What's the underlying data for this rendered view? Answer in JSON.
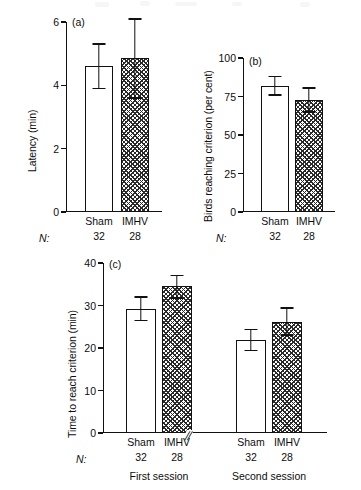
{
  "figure": {
    "panels": [
      "a",
      "b",
      "c"
    ]
  },
  "chart_data": [
    {
      "type": "bar",
      "panel": "(a)",
      "title": "",
      "xlabel": "",
      "ylabel": "Latency (min)",
      "ylim": [
        0,
        6
      ],
      "yticks": [
        0,
        2,
        4,
        6
      ],
      "ytick_labels": [
        "0",
        "2",
        "4",
        "6"
      ],
      "grid": false,
      "legend": "none",
      "categories": [
        "Sham",
        "IMHV"
      ],
      "values": [
        4.6,
        4.85
      ],
      "errors_low": [
        3.9,
        3.6
      ],
      "errors_high": [
        5.3,
        6.1
      ],
      "n_label": "N:",
      "n_values": [
        "32",
        "28"
      ],
      "fills": [
        "open",
        "hatched"
      ]
    },
    {
      "type": "bar",
      "panel": "(b)",
      "title": "",
      "xlabel": "",
      "ylabel": "Birds reaching criterion (per cent)",
      "ylim": [
        0,
        100
      ],
      "yticks": [
        0,
        25,
        50,
        75,
        100
      ],
      "ytick_labels": [
        "0",
        "25",
        "50",
        "75",
        "100"
      ],
      "grid": false,
      "legend": "none",
      "categories": [
        "Sham",
        "IMHV"
      ],
      "values": [
        82,
        72.5
      ],
      "errors_low": [
        76,
        65
      ],
      "errors_high": [
        88,
        80.5
      ],
      "n_label": "N:",
      "n_values": [
        "32",
        "28"
      ],
      "fills": [
        "open",
        "hatched"
      ]
    },
    {
      "type": "bar",
      "panel": "(c)",
      "title": "",
      "xlabel": "",
      "ylabel": "Time to reach criterion (min)",
      "ylim": [
        0,
        40
      ],
      "yticks": [
        0,
        10,
        20,
        30,
        40
      ],
      "ytick_labels": [
        "0",
        "10",
        "20",
        "30",
        "40"
      ],
      "grid": false,
      "legend": "none",
      "axis_break": "//",
      "groups": [
        "First session",
        "Second session"
      ],
      "categories": [
        "Sham",
        "IMHV",
        "Sham",
        "IMHV"
      ],
      "values": [
        29.2,
        34.5,
        21.9,
        26.2
      ],
      "errors_low": [
        26.4,
        31.8,
        19.4,
        23.1
      ],
      "errors_high": [
        32.0,
        37.0,
        24.4,
        29.4
      ],
      "n_label": "N:",
      "n_values": [
        "32",
        "28",
        "32",
        "28"
      ],
      "fills": [
        "open",
        "hatched",
        "open",
        "hatched"
      ]
    }
  ]
}
